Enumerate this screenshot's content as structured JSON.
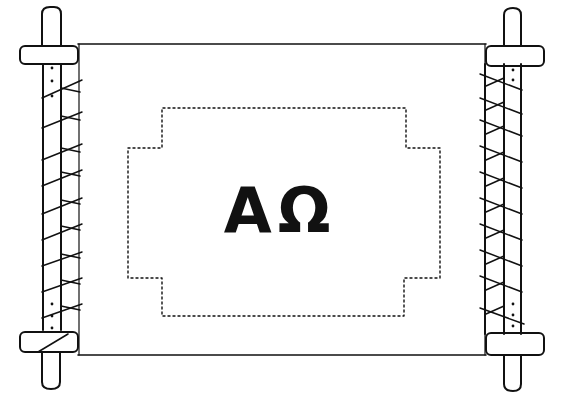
{
  "illustration": {
    "subject": "scroll",
    "inscription": {
      "alpha": "A",
      "omega": "Ω"
    },
    "colors": {
      "ink": "#111111",
      "paper": "#ffffff"
    },
    "frame": {
      "style": "dotted",
      "shape": "stepped-rectangle"
    }
  }
}
